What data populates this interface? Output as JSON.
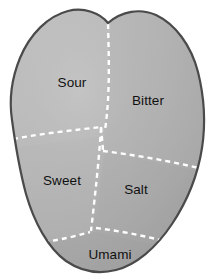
{
  "diagram": {
    "type": "anatomical-region-map",
    "shape_name": "tongue-outline",
    "colors": {
      "fill_light": "#bdbdbd",
      "fill_mid": "#b0b0b0",
      "fill_dark": "#9a9a9a",
      "outline": "#4a4a4a",
      "divider": "#ffffff",
      "label_text": "#111111",
      "background": "#ffffff"
    },
    "divider_style": {
      "stroke": "#ffffff",
      "dash": "5 4",
      "width": 2.4
    },
    "regions": [
      {
        "id": "sour",
        "label": "Sour",
        "label_x": 72,
        "label_y": 83,
        "position": "upper-left"
      },
      {
        "id": "bitter",
        "label": "Bitter",
        "label_x": 148,
        "label_y": 101,
        "position": "upper-right"
      },
      {
        "id": "sweet",
        "label": "Sweet",
        "label_x": 62,
        "label_y": 181,
        "position": "lower-left"
      },
      {
        "id": "salt",
        "label": "Salt",
        "label_x": 136,
        "label_y": 190,
        "position": "lower-right"
      },
      {
        "id": "umami",
        "label": "Umami",
        "label_x": 110,
        "label_y": 255,
        "position": "bottom-center"
      }
    ]
  }
}
